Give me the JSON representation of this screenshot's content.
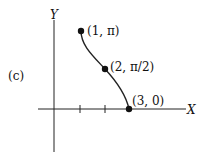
{
  "figure": {
    "panel_label": "(c)",
    "axes": {
      "x_label": "X",
      "y_label": "Y"
    },
    "points": [
      {
        "label": "(1, π)",
        "x": 1,
        "y": "π"
      },
      {
        "label": "(2, π/2)",
        "x": 2,
        "y": "π/2"
      },
      {
        "label": "(3, 0)",
        "x": 3,
        "y": 0
      }
    ],
    "colors": {
      "ink": "#111111",
      "background": "#ffffff"
    }
  }
}
